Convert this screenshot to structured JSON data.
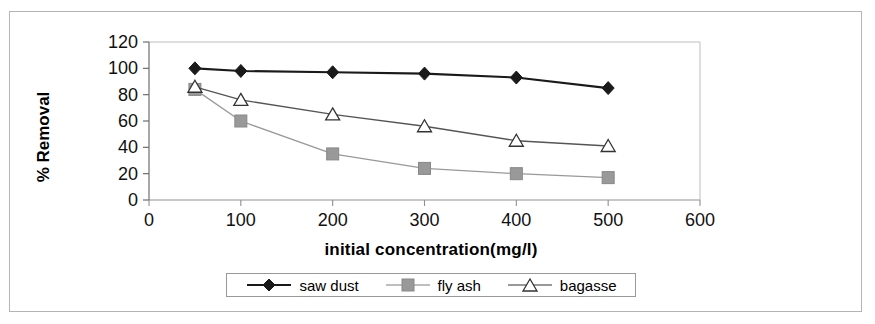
{
  "chart_data": {
    "type": "line",
    "title": "",
    "xlabel": "initial concentration(mg/l)",
    "ylabel": "% Removal",
    "x": [
      50,
      100,
      200,
      300,
      400,
      500
    ],
    "xlim": [
      0,
      600
    ],
    "ylim": [
      0,
      120
    ],
    "xticks": [
      "0",
      "100",
      "200",
      "300",
      "400",
      "500",
      "600"
    ],
    "yticks": [
      "0",
      "20",
      "40",
      "60",
      "80",
      "100",
      "120"
    ],
    "xtick_values": [
      0,
      100,
      200,
      300,
      400,
      500,
      600
    ],
    "ytick_values": [
      0,
      20,
      40,
      60,
      80,
      100,
      120
    ],
    "grid": false,
    "legend_position": "bottom",
    "series": [
      {
        "name": "saw dust",
        "marker": "filled-diamond",
        "color": "#1a1a1a",
        "values": [
          100,
          98,
          97,
          96,
          93,
          85
        ]
      },
      {
        "name": "fly ash",
        "marker": "filled-square",
        "color": "#999999",
        "values": [
          84,
          60,
          35,
          24,
          20,
          17
        ]
      },
      {
        "name": "bagasse",
        "marker": "open-triangle",
        "color": "#555555",
        "values": [
          86,
          76,
          65,
          56,
          45,
          41
        ]
      }
    ]
  },
  "legend": {
    "items": [
      {
        "label": "saw dust"
      },
      {
        "label": "fly ash"
      },
      {
        "label": "bagasse"
      }
    ]
  },
  "colors": {
    "saw_dust": "#1a1a1a",
    "fly_ash": "#999999",
    "bagasse": "#555555",
    "axis": "#808080",
    "frame": "#b4b4b4",
    "background": "#ffffff"
  }
}
